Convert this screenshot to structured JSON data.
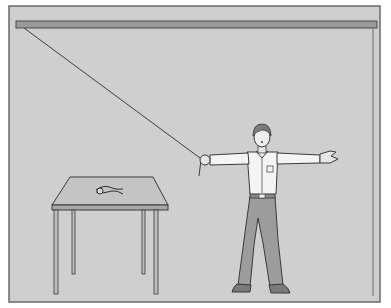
{
  "illustration": {
    "subject": "man holding a rope attached to ceiling, arms outstretched, table with pliers",
    "colors": {
      "background": "#ffffff",
      "wall": "#cfcfcf",
      "frame_stroke": "#6a6a6a",
      "ceiling_beam": "#9a9a9a",
      "outline": "#3a3a3a",
      "shirt": "#f4f4f4",
      "pants": "#9c9c9c",
      "hair": "#7a7a7a",
      "table_top": "#c4c4c4",
      "table_edge": "#a8a8a8",
      "rope": "#4a4a4a"
    },
    "objects": [
      {
        "name": "ceiling-beam"
      },
      {
        "name": "rope"
      },
      {
        "name": "man"
      },
      {
        "name": "table"
      },
      {
        "name": "pliers"
      }
    ]
  }
}
